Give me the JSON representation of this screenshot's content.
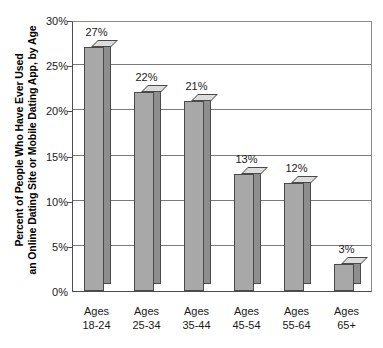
{
  "chart_data": {
    "type": "bar",
    "title": "",
    "xlabel": "",
    "ylabel": "Percent of People Who Have Ever Used an Online Dating Site or Mobile Dating App, by Age",
    "ylabel_lines": [
      "Percent of People Who Have Ever Used",
      "an Online Dating Site or Mobile Dating App, by Age"
    ],
    "categories": [
      "Ages 18-24",
      "Ages 25-34",
      "Ages 35-44",
      "Ages 45-54",
      "Ages 55-64",
      "Ages 65+"
    ],
    "category_lines": [
      [
        "Ages",
        "18-24"
      ],
      [
        "Ages",
        "25-34"
      ],
      [
        "Ages",
        "35-44"
      ],
      [
        "Ages",
        "45-54"
      ],
      [
        "Ages",
        "55-64"
      ],
      [
        "Ages",
        "65+"
      ]
    ],
    "values": [
      27,
      22,
      21,
      13,
      12,
      3
    ],
    "data_labels": [
      "27%",
      "22%",
      "21%",
      "13%",
      "12%",
      "3%"
    ],
    "ylim": [
      0,
      30
    ],
    "ytick_values": [
      0,
      5,
      10,
      15,
      20,
      25,
      30
    ],
    "ytick_labels": [
      "0%",
      "5%",
      "10%",
      "15%",
      "20%",
      "25%",
      "30%"
    ],
    "grid": true,
    "legend": false,
    "legend_position": "none",
    "style": "3d-column",
    "colors": {
      "bar_front": "#a8a8a8",
      "bar_top": "#dcdcdc",
      "bar_side": "#8e8e8e",
      "bar_edge": "#4a4a4a",
      "gridline": "#7a7a7a",
      "axis": "#4d4d4d",
      "text": "#1a1a1a",
      "background": "#ffffff"
    }
  }
}
